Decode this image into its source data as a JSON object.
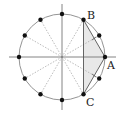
{
  "diagram": {
    "type": "unit-circle-12-points",
    "center": [
      62,
      57
    ],
    "radius": 43,
    "point_count": 12,
    "labels": {
      "A": "A",
      "B": "B",
      "C": "C"
    },
    "colors": {
      "circle": "#888888",
      "axes": "#777777",
      "dashed": "#aaaaaa",
      "points": "#111111",
      "shade": "#e6e6e6",
      "chord": "#555555"
    }
  }
}
